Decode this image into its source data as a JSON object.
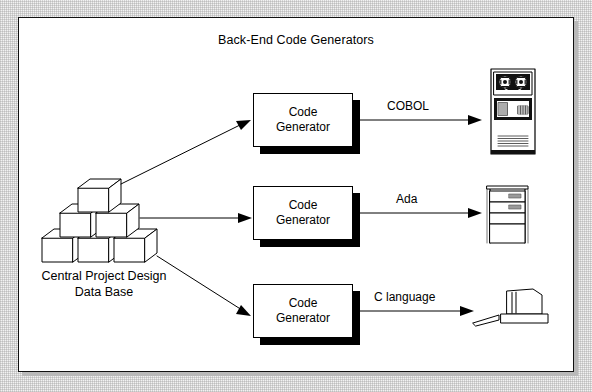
{
  "diagram": {
    "title": "Back-End Code Generators",
    "source": {
      "caption_line1": "Central Project Design",
      "caption_line2": "Data Base",
      "icon": "cube-stack-icon",
      "cube_count": 6
    },
    "processes": [
      {
        "id": "cg-cobol",
        "line1": "Code",
        "line2": "Generator"
      },
      {
        "id": "cg-ada",
        "line1": "Code",
        "line2": "Generator"
      },
      {
        "id": "cg-c",
        "line1": "Code",
        "line2": "Generator"
      }
    ],
    "flows": [
      {
        "label": "COBOL",
        "target_icon": "mainframe-icon"
      },
      {
        "label": "Ada",
        "target_icon": "minicomputer-tower-icon"
      },
      {
        "label": "C language",
        "target_icon": "workstation-icon"
      }
    ],
    "colors": {
      "ink": "#000000",
      "paper": "#ffffff",
      "margin": "#f2f2f2",
      "shadow": "#000000",
      "frame_shadow": "#b9b9b9"
    }
  }
}
